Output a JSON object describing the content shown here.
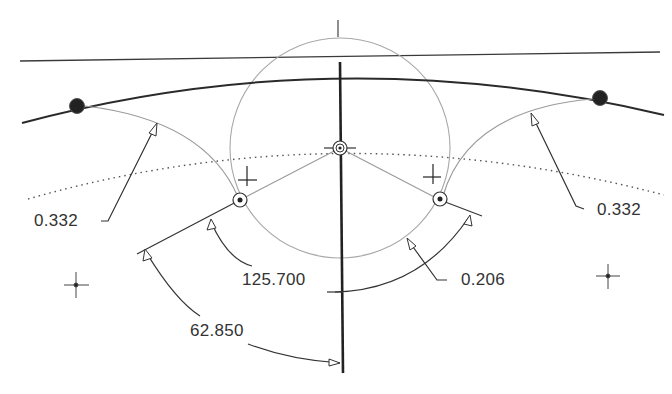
{
  "diagram": {
    "type": "cad-sketch",
    "colors": {
      "background": "#ffffff",
      "primary_line": "#2a2a2a",
      "construction_line": "#9a9a9a",
      "dotted_line": "#555555",
      "text": "#333333"
    }
  },
  "dimensions": [
    {
      "id": "radius-left",
      "label": "0.332",
      "type": "radius"
    },
    {
      "id": "radius-right",
      "label": "0.332",
      "type": "radius"
    },
    {
      "id": "angle-inner",
      "label": "125.700",
      "type": "angle"
    },
    {
      "id": "radius-small",
      "label": "0.206",
      "type": "radius"
    },
    {
      "id": "angle-half",
      "label": "62.850",
      "type": "angle"
    }
  ],
  "points": [
    {
      "id": "endpoint-left",
      "x": 77,
      "y": 106
    },
    {
      "id": "endpoint-right",
      "x": 600,
      "y": 98
    },
    {
      "id": "center",
      "x": 340,
      "y": 148
    },
    {
      "id": "tangent-left",
      "x": 240,
      "y": 200
    },
    {
      "id": "tangent-right",
      "x": 440,
      "y": 200
    },
    {
      "id": "origin-left",
      "x": 76,
      "y": 285
    },
    {
      "id": "origin-right",
      "x": 608,
      "y": 276
    }
  ]
}
